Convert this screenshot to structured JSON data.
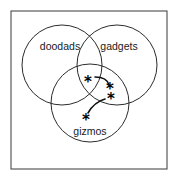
{
  "figure": {
    "kind": "venn-diagram",
    "frame": {
      "x": 11,
      "y": 11,
      "width": 156,
      "height": 158,
      "stroke_color": "#4a4a4a"
    },
    "background_color": "#ffffff",
    "line_color": "#2b2b2b"
  },
  "sets": [
    {
      "id": "doodads",
      "label": "doodads",
      "cx": 62,
      "cy": 65,
      "r": 40,
      "label_x": 60,
      "label_y": 47
    },
    {
      "id": "gadgets",
      "label": "gadgets",
      "cx": 117,
      "cy": 65,
      "r": 40,
      "label_x": 119,
      "label_y": 47
    },
    {
      "id": "gizmos",
      "label": "gizmos",
      "cx": 90,
      "cy": 103,
      "r": 39,
      "label_x": 90,
      "label_y": 132
    }
  ],
  "markers": [
    {
      "id": "marker-1",
      "glyph": "*",
      "x": 88,
      "y": 80,
      "region": "triple-intersection"
    },
    {
      "id": "marker-2",
      "glyph": "*",
      "x": 110,
      "y": 87,
      "region": "gadgets-only"
    },
    {
      "id": "marker-3",
      "glyph": "*",
      "x": 111,
      "y": 97,
      "region": "gadgets-gizmos"
    },
    {
      "id": "marker-4",
      "glyph": "*",
      "x": 86,
      "y": 118,
      "region": "gizmos-only"
    }
  ],
  "connectors": [
    {
      "id": "connector-upper",
      "path": "M 95 77 C 104 77 108 81 109 85",
      "from": "marker-1",
      "to": "marker-2"
    },
    {
      "id": "connector-lower",
      "path": "M 105 99 C 98 101 92 106 88 113",
      "from": "marker-3",
      "to": "marker-4"
    }
  ]
}
